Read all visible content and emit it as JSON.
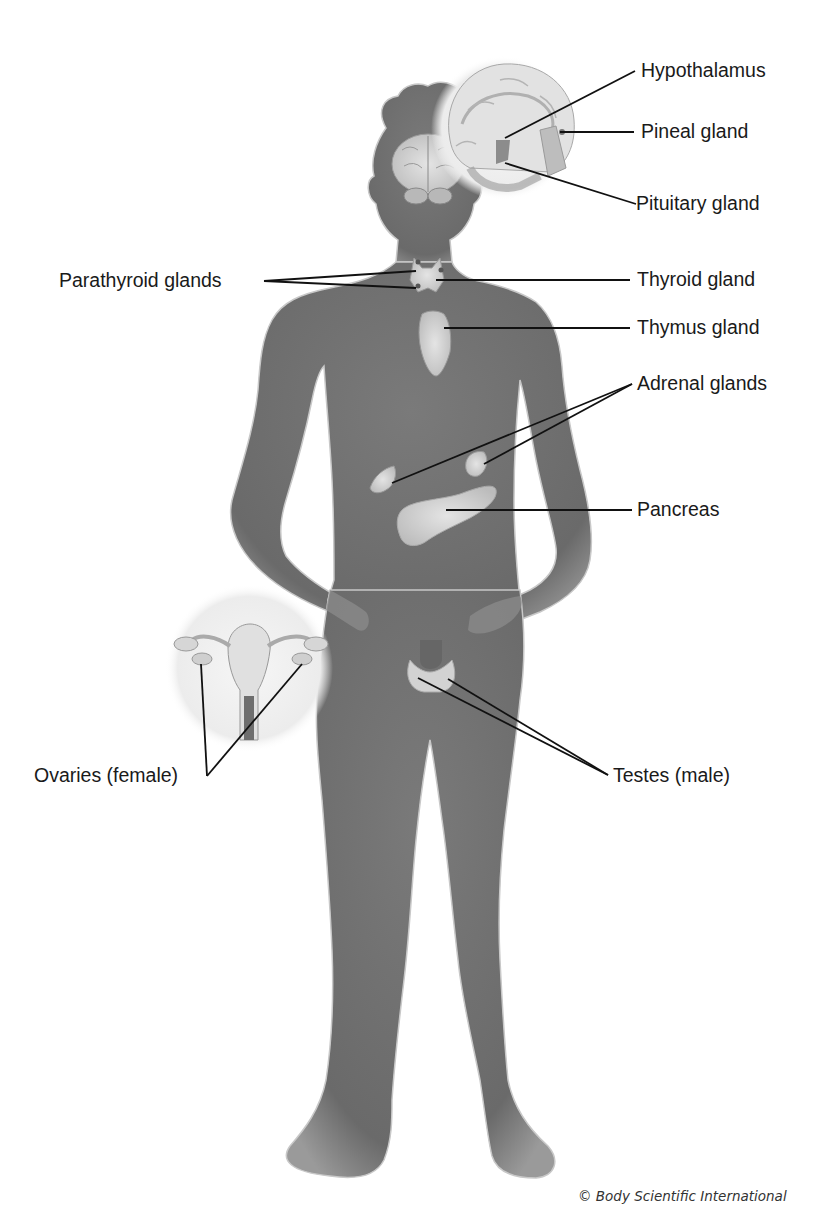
{
  "figure": {
    "colors": {
      "background": "#ffffff",
      "body": "#6e6e6e",
      "body_edge": "#bdbdbd",
      "organ": "#d6d6d6",
      "inset": "#efefef",
      "leader_line": "#111111",
      "label_text": "#1a1a1a"
    }
  },
  "labels": {
    "hypothalamus": "Hypothalamus",
    "pineal": "Pineal gland",
    "pituitary": "Pituitary gland",
    "parathyroid": "Parathyroid glands",
    "thyroid": "Thyroid gland",
    "thymus": "Thymus gland",
    "adrenal": "Adrenal glands",
    "pancreas": "Pancreas",
    "ovaries": "Ovaries (female)",
    "testes": "Testes (male)"
  },
  "insets": {
    "brain": "brain-sagittal-inset",
    "uterus": "female-reproductive-inset"
  },
  "credit": "© Body Scientific International"
}
